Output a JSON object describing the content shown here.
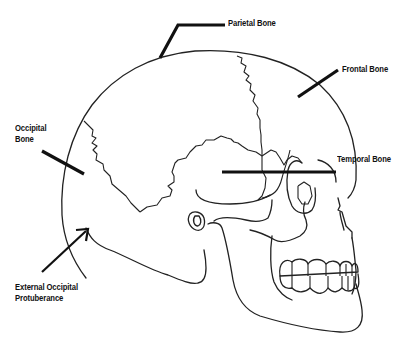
{
  "diagram": {
    "labels": {
      "parietal": "Parietal Bone",
      "frontal": "Frontal Bone",
      "occipital_line1": "Occipital",
      "occipital_line2": "Bone",
      "temporal": "Temporal Bone",
      "protuberance_line1": "External Occipital",
      "protuberance_line2": "Protuberance"
    },
    "colors": {
      "line": "#222222",
      "leader": "#111111",
      "background": "#ffffff"
    }
  }
}
